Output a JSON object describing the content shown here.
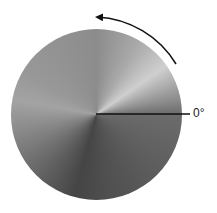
{
  "diagram": {
    "type": "conic-gradient-angle-diagram",
    "zero_label": "0°",
    "direction": "counterclockwise",
    "colors": {
      "background": "#ffffff",
      "line": "#111111",
      "arrow": "#111111",
      "brightest": "#cfcfcf",
      "darkest": "#454545"
    }
  }
}
